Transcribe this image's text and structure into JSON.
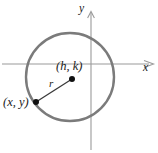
{
  "figure": {
    "background_color": "#ffffff",
    "width": 158,
    "height": 153
  },
  "axes": {
    "x_axis": {
      "label": "x",
      "icon": "arrow-right-icon",
      "color": "#9a9a9a",
      "y_position": 64,
      "x_start": 2,
      "x_end": 152
    },
    "y_axis": {
      "label": "y",
      "icon": "arrow-up-icon",
      "color": "#9a9a9a",
      "x_position": 91,
      "y_start": 10,
      "y_end": 150
    }
  },
  "circle": {
    "center_x": 70,
    "center_y": 77,
    "radius": 44,
    "stroke_color": "#7b7b7b",
    "stroke_width": 2.4,
    "fill": "none"
  },
  "points": [
    {
      "name": "center-point",
      "label": "(h, k)",
      "x": 72,
      "y": 79,
      "dot_radius": 3,
      "color": "#111111"
    },
    {
      "name": "circle-point",
      "label": "(x, y)",
      "x": 36,
      "y": 102,
      "dot_radius": 3,
      "color": "#111111"
    }
  ],
  "radius_segment": {
    "label": "r",
    "from_x": 36,
    "from_y": 102,
    "to_x": 72,
    "to_y": 79,
    "color": "#3a3a3a",
    "stroke_width": 1.3,
    "label_x": 52,
    "label_y": 84
  }
}
